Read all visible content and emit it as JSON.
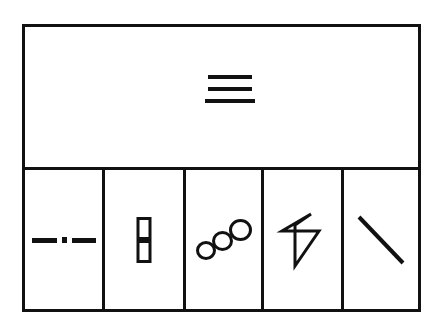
{
  "canvas": {
    "width": 442,
    "height": 329,
    "background": "#ffffff",
    "stroke_color": "#111111"
  },
  "figure": {
    "title": "",
    "frame": {
      "x": 22,
      "y": 24,
      "width": 399,
      "height": 288,
      "border_width": 3
    },
    "layout": "one wide top panel above a row of five equal cells"
  },
  "top_panel": {
    "name": "top-panel",
    "glyph": {
      "icon_name": "hamburger-icon",
      "description": "three stacked horizontal bars",
      "bar_count": 3,
      "bars": [
        {
          "x": 3,
          "y": 0,
          "width": 44,
          "height": 4
        },
        {
          "x": 3,
          "y": 12,
          "width": 44,
          "height": 4
        },
        {
          "x": 0,
          "y": 24,
          "width": 50,
          "height": 4
        }
      ]
    }
  },
  "bottom_row": {
    "cell_count": 5,
    "cells": [
      {
        "index": 1,
        "icon_name": "dash-dot-dash-icon",
        "description": "horizontal dash, square dot, horizontal dash",
        "segments": [
          {
            "type": "dash",
            "length": 25
          },
          {
            "type": "dot",
            "length": 5
          },
          {
            "type": "dash",
            "length": 24
          }
        ]
      },
      {
        "index": 2,
        "icon_name": "stacked-rectangles-icon",
        "description": "two small outlined rectangles stacked vertically",
        "rect_count": 2,
        "rect_width": 15,
        "rect_height": 23
      },
      {
        "index": 3,
        "icon_name": "three-overlapping-circles-icon",
        "description": "three outlined circles on a rising diagonal, growing in size",
        "circle_count": 3,
        "circle_diameters": [
          20,
          21,
          23
        ]
      },
      {
        "index": 4,
        "icon_name": "zigzag-arrow-icon",
        "description": "angular zigzag / lightning-bolt-like arrow outline",
        "vertex_count": 6
      },
      {
        "index": 5,
        "icon_name": "diagonal-line-icon",
        "description": "single diagonal stroke from upper-left to lower-right",
        "angle_degrees": 45,
        "stroke_width": 4
      }
    ]
  }
}
